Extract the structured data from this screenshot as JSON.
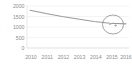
{
  "chart_data": {
    "type": "line",
    "title": "",
    "subtitle": "",
    "xlabel": "",
    "ylabel": "",
    "categories": [
      "2010",
      "2011",
      "2012",
      "2013",
      "2014",
      "2015",
      "2016"
    ],
    "x": [
      2010,
      2011,
      2012,
      2013,
      2014,
      2015,
      2016
    ],
    "series": [
      {
        "name": "",
        "color": "#9a9a9a",
        "values": [
          1800,
          1640,
          1500,
          1380,
          1260,
          1180,
          1150
        ]
      }
    ],
    "y_ticks": [
      0,
      500,
      1000,
      1500,
      2000
    ],
    "y_tick_labels": [
      "0",
      "500",
      "1000",
      "1500",
      "2000"
    ],
    "x_tick_labels": [
      "2010",
      "2011",
      "2012",
      "2013",
      "2014",
      "2015",
      "2016"
    ],
    "ylim": [
      0,
      2000
    ],
    "xlim": [
      2010,
      2016
    ],
    "grid": true,
    "grid_axis": "y",
    "legend": false,
    "legend_position": "none",
    "annotations": [
      {
        "type": "ellipse-highlight",
        "label": "",
        "target_x": 2016,
        "target_y": 1150,
        "note": "hand-drawn circle around final data point"
      }
    ]
  },
  "axes": {
    "y_axis_name": "y-axis",
    "x_axis_name": "x-axis"
  }
}
